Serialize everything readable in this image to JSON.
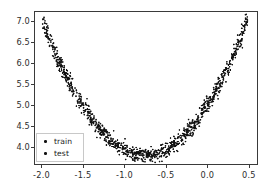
{
  "figure": {
    "background_color": "#ffffff",
    "axes_edge_color": "#3a3a3a",
    "tick_color": "#2b2b2b"
  },
  "legend": {
    "border_color": "#c8c8c8",
    "entries": [
      {
        "label": "train",
        "marker": "dot",
        "color": "#111111"
      },
      {
        "label": "test",
        "marker": "dot",
        "color": "#111111"
      }
    ]
  },
  "chart_data": {
    "type": "scatter",
    "title": "",
    "xlabel": "",
    "ylabel": "",
    "xlim": [
      -2.09,
      0.61
    ],
    "ylim": [
      3.58,
      7.24
    ],
    "grid": false,
    "legend_position": "lower left",
    "xticks": [
      -2.0,
      -1.5,
      -1.0,
      -0.5,
      0.0,
      0.5
    ],
    "xtick_labels": [
      "-2.0",
      "-1.5",
      "-1.0",
      "-0.5",
      "0.0",
      "0.5"
    ],
    "yticks": [
      4.0,
      4.5,
      5.0,
      5.5,
      6.0,
      6.5,
      7.0
    ],
    "ytick_labels": [
      "4.0",
      "4.5",
      "5.0",
      "5.5",
      "6.0",
      "6.5",
      "7.0"
    ],
    "marker": {
      "shape": "circle",
      "color": "#111111",
      "size": 1.6
    },
    "curve_model": {
      "form": "quadratic",
      "a": 2.07,
      "b": 3.12,
      "c": 4.97,
      "equation": "y = 2.07*x^2 + 3.12*x + 4.97",
      "vertex": [
        -0.754,
        3.793
      ],
      "noise_std": 0.075
    },
    "series": [
      {
        "name": "train",
        "n_points": 900,
        "color": "#111111",
        "x_range": [
          -2.0,
          0.5
        ]
      },
      {
        "name": "test",
        "n_points": 200,
        "color": "#111111",
        "x_range": [
          -2.0,
          0.5
        ]
      }
    ],
    "sample_points": {
      "x": [
        -2.0,
        -1.9,
        -1.8,
        -1.7,
        -1.6,
        -1.5,
        -1.4,
        -1.3,
        -1.2,
        -1.1,
        -1.0,
        -0.9,
        -0.8,
        -0.75,
        -0.7,
        -0.6,
        -0.5,
        -0.4,
        -0.3,
        -0.2,
        -0.1,
        0.0,
        0.1,
        0.2,
        0.3,
        0.4,
        0.5
      ],
      "y": [
        6.99,
        6.48,
        6.06,
        5.65,
        5.28,
        4.95,
        4.66,
        4.4,
        4.2,
        4.04,
        3.92,
        3.84,
        3.8,
        3.79,
        3.8,
        3.84,
        3.93,
        4.05,
        4.22,
        4.43,
        4.68,
        4.97,
        5.3,
        5.67,
        6.09,
        6.55,
        7.05
      ]
    }
  }
}
